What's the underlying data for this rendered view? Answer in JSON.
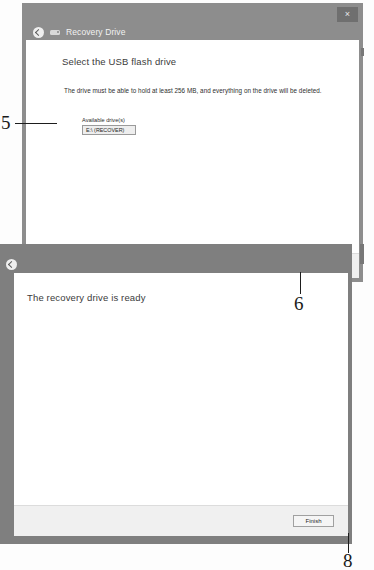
{
  "figure": {
    "kind": "annotated-screenshot-figure",
    "annotations": [
      {
        "number": "5",
        "points_to": "available-drives-list"
      },
      {
        "number": "6",
        "points_to": "next-button"
      },
      {
        "number": "8",
        "points_to": "finish-button"
      }
    ]
  },
  "window_one": {
    "title": "Recovery Drive",
    "back_icon": "back-arrow-icon",
    "app_icon": "usb-drive-icon",
    "close_label": "×",
    "heading": "Select the USB flash drive",
    "description": "The drive must be able to hold at least 256 MB, and everything on the drive will be deleted.",
    "group_label": "Available drive(s)",
    "drives": [
      "E:\\ (RECOVER)"
    ],
    "buttons": {
      "next": "Next",
      "cancel": "Cancel"
    }
  },
  "window_two": {
    "back_icon": "back-arrow-icon",
    "heading": "The recovery drive is ready",
    "buttons": {
      "finish": "Finish"
    }
  },
  "colors": {
    "titlebar": "#8d8d8d",
    "client": "#ffffff",
    "footer": "#f0f0f0",
    "button_face": "#f5f5f5",
    "button_border": "#a0a0a0",
    "ink": "#1d1d1d"
  }
}
